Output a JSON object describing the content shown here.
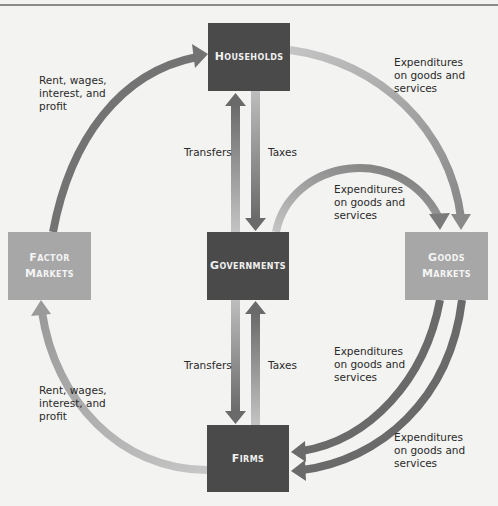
{
  "nodes": {
    "households": {
      "label": "Households"
    },
    "governments": {
      "label": "Governments"
    },
    "firms": {
      "label": "Firms"
    },
    "factor_markets": {
      "line1": "Factor",
      "line2": "Markets"
    },
    "goods_markets": {
      "line1": "Goods",
      "line2": "Markets"
    }
  },
  "labels": {
    "rent_top": "Rent, wages,\ninterest, and\nprofit",
    "rent_bottom": "Rent, wages,\ninterest, and\nprofit",
    "exp_households": "Expenditures\non goods and\nservices",
    "exp_gov_to_goods": "Expenditures\non goods and\nservices",
    "exp_goods_to_firms_inner": "Expenditures\non goods and\nservices",
    "exp_goods_to_firms_outer": "Expenditures\non goods and\nservices",
    "transfers_top": "Transfers",
    "taxes_top": "Taxes",
    "transfers_bottom": "Transfers",
    "taxes_bottom": "Taxes"
  },
  "colors": {
    "dark_box": "#4a4a4a",
    "light_box": "#a7a7a7",
    "arrow_dark": "#6e6e6e",
    "arrow_light": "#b8b8b8",
    "background": "#f3f3f1"
  }
}
